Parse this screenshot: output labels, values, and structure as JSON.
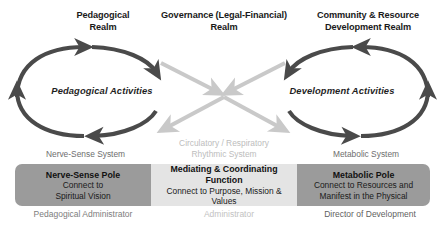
{
  "diagram": {
    "colors": {
      "dark_arrow": "#4a4a4a",
      "light_arrow": "#c9c9c9",
      "pole_box": "#9b9b9b",
      "mediating_box": "#e4e4e4",
      "heading_text": "#1a1a1a",
      "muted_text": "#6e6e6e",
      "faint_text": "#c2c2c2"
    },
    "realms": [
      {
        "id": "pedagogical",
        "line1": "Pedagogical",
        "line2": "Realm"
      },
      {
        "id": "governance",
        "line1": "Governance (Legal-Financial)",
        "line2": "Realm"
      },
      {
        "id": "community",
        "line1": "Community & Resource",
        "line2": "Development Realm"
      }
    ],
    "loops": [
      {
        "id": "pedagogical-activities",
        "label": "Pedagogical Activities"
      },
      {
        "id": "development-activities",
        "label": "Development Activities"
      }
    ],
    "systems": [
      {
        "id": "nerve-sense",
        "line1": "Nerve-Sense System",
        "line2": ""
      },
      {
        "id": "rhythmic",
        "line1": "Circulatory / Respiratory",
        "line2": "Rhythmic System"
      },
      {
        "id": "metabolic",
        "line1": "Metabolic System",
        "line2": ""
      }
    ],
    "poles": [
      {
        "id": "nerve-sense-pole",
        "title": "Nerve-Sense Pole",
        "sub1": "Connect to",
        "sub2": "Spiritual Vision",
        "fill": "#9b9b9b"
      },
      {
        "id": "mediating-coordinating-function",
        "title_line1": "Mediating & Coordinating",
        "title_line2": "Function",
        "sub1": "Connect to Purpose, Mission & Values",
        "sub2": "",
        "fill": "#e4e4e4"
      },
      {
        "id": "metabolic-pole",
        "title": "Metabolic Pole",
        "sub1": "Connect to Resources and",
        "sub2": "Manifest in the Physical",
        "fill": "#9b9b9b"
      }
    ],
    "roles": [
      {
        "id": "pedagogical-administrator",
        "label": "Pedagogical Administrator"
      },
      {
        "id": "administrator",
        "label": "Administrator"
      },
      {
        "id": "director-of-development",
        "label": "Director of Development"
      }
    ],
    "arrows": {
      "left_loop_direction": "clockwise",
      "right_loop_direction": "counter-clockwise",
      "center_cross_count": 4,
      "center_cross_color": "#c9c9c9"
    }
  }
}
